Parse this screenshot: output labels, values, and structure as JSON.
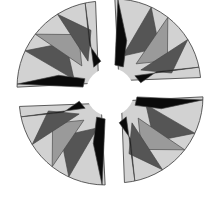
{
  "figure": {
    "colors": {
      "background": "#ffffff",
      "light": "#d2d2d2",
      "mid": "#9a9a9a",
      "dark": "#555555",
      "black": "#0a0a0a",
      "center": "#ffffff",
      "stroke": "#444444"
    },
    "blades": [
      {
        "name": "blade-top-left",
        "rotation": 0
      },
      {
        "name": "blade-top-right",
        "rotation": 90
      },
      {
        "name": "blade-bottom-right",
        "rotation": 180
      },
      {
        "name": "blade-bottom-left",
        "rotation": 270
      }
    ]
  }
}
